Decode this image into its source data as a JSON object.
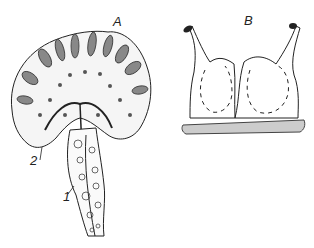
{
  "figure": {
    "panels": [
      {
        "id": "A",
        "label": "A",
        "description": "Sectioned mushroom-shaped structure with radial cells on a cellular stalk"
      },
      {
        "id": "B",
        "label": "B",
        "description": "Two-lobed body with two stalked tips on a stippled base, dashed internal circulation arrows"
      }
    ],
    "annotations": [
      {
        "label": "1",
        "target": "stalk"
      },
      {
        "label": "2",
        "target": "cap margin"
      }
    ],
    "colors": {
      "ink": "#222222",
      "paper": "#ffffff",
      "stipple": "#bdbdbd"
    }
  }
}
